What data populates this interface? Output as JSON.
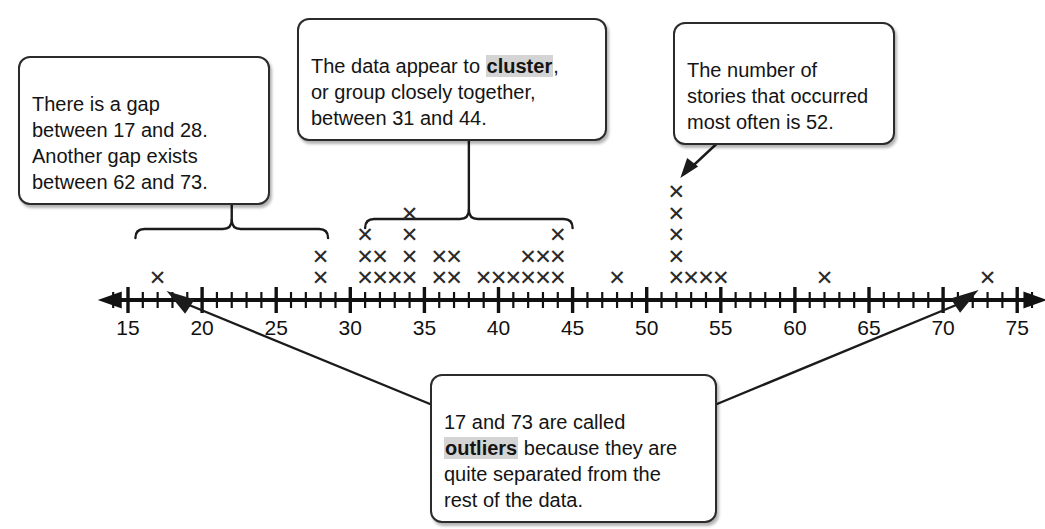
{
  "figure": {
    "xlabel": ""
  },
  "callouts": {
    "gap": {
      "id": "gap-callout",
      "text": "There is a gap\nbetween 17 and 28.\nAnother gap exists\nbetween 62 and 73."
    },
    "cluster": {
      "id": "cluster-callout",
      "before": "The data appear to ",
      "keyword": "cluster",
      "after": ",\nor group closely together,\nbetween 31 and 44."
    },
    "mode": {
      "id": "mode-callout",
      "text": "The number of\nstories that occurred\nmost often is 52."
    },
    "outlier": {
      "id": "outlier-callout",
      "before": "17 and 73 are called\n",
      "keyword": "outliers",
      "after": " because they are\nquite separated from the\nrest of the data."
    }
  },
  "axis": {
    "min": 13.5,
    "max": 76.5,
    "tick_labels": [
      "15",
      "20",
      "25",
      "30",
      "35",
      "40",
      "45",
      "50",
      "55",
      "60",
      "65",
      "70",
      "75"
    ],
    "tick_values": [
      15,
      20,
      25,
      30,
      35,
      40,
      45,
      50,
      55,
      60,
      65,
      70,
      75
    ],
    "minor_tick_step": 1,
    "major_tick_step": 5,
    "arrows": "both"
  },
  "annotations": {
    "gap_bracket": {
      "from": 15.5,
      "to": 28.5,
      "label_target": "gap-callout"
    },
    "cluster_bracket": {
      "from": 31,
      "to": 45,
      "label_target": "cluster-callout"
    },
    "mode_arrow": {
      "target_value": 52,
      "label_target": "mode-callout"
    },
    "outlier_arrow_left": {
      "target_value": 17,
      "label_target": "outlier-callout"
    },
    "outlier_arrow_right": {
      "target_value": 73,
      "label_target": "outlier-callout"
    }
  },
  "chart_data": {
    "type": "scatter",
    "plot_kind": "dot-plot",
    "marker": "x",
    "title": "",
    "xlabel": "",
    "ylabel": "",
    "xlim": [
      13.5,
      76.5
    ],
    "grid": false,
    "legend": null,
    "x": [
      17,
      28,
      31,
      32,
      33,
      34,
      36,
      37,
      39,
      40,
      41,
      42,
      43,
      44,
      48,
      52,
      53,
      54,
      55,
      62,
      73
    ],
    "counts": [
      1,
      2,
      3,
      2,
      1,
      4,
      2,
      2,
      1,
      1,
      1,
      2,
      2,
      3,
      1,
      5,
      1,
      1,
      1,
      1,
      1
    ],
    "total_points": 38,
    "mode": 52,
    "outliers": [
      17,
      73
    ],
    "gaps": [
      [
        17,
        28
      ],
      [
        62,
        73
      ]
    ],
    "cluster_range": [
      31,
      44
    ]
  }
}
